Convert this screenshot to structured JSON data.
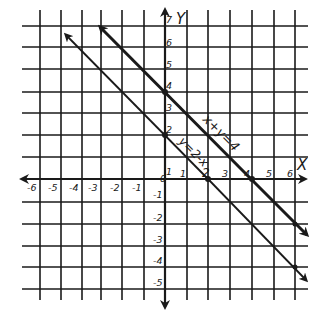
{
  "diagram": {
    "type": "coordinate-plane-graph",
    "axes": {
      "x_label": "X",
      "y_label": "Y",
      "x_ticks": [
        "-6",
        "-5",
        "-4",
        "-3",
        "-2",
        "-1",
        "0",
        "1",
        "2",
        "3",
        "4",
        "5",
        "6"
      ],
      "y_ticks_pos": [
        "1",
        "2",
        "3",
        "4",
        "5",
        "6",
        "7"
      ],
      "y_ticks_neg": [
        "-1",
        "-2",
        "-3",
        "-4",
        "-5"
      ]
    },
    "lines": [
      {
        "label": "x+y=4",
        "weight": "bold",
        "points": [
          [
            0,
            4
          ],
          [
            4,
            0
          ]
        ]
      },
      {
        "label": "y=2-x",
        "weight": "thin",
        "points": [
          [
            0,
            2
          ],
          [
            2,
            0
          ]
        ]
      }
    ],
    "colors": {
      "ink": "#1a1a1a",
      "background": "#ffffff"
    }
  }
}
